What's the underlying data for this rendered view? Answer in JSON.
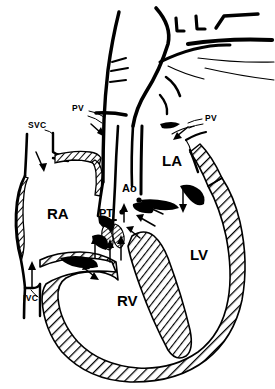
{
  "figure": {
    "type": "anatomical-line-diagram",
    "background_color": "#ffffff",
    "ink_color": "#000000",
    "width": 275,
    "height": 389
  },
  "labels": {
    "svc": "SVC",
    "ivc": "IVC",
    "pv_left": "PV",
    "pv_right": "PV",
    "ra": "RA",
    "rv": "RV",
    "la": "LA",
    "lv": "LV",
    "ao": "Ao",
    "pt": "PT"
  },
  "label_positions": {
    "svc": {
      "x": 28,
      "y": 128
    },
    "ivc": {
      "x": 23,
      "y": 301
    },
    "pv_left": {
      "x": 72,
      "y": 111
    },
    "pv_right": {
      "x": 205,
      "y": 121
    },
    "ra": {
      "x": 47,
      "y": 219
    },
    "rv": {
      "x": 117,
      "y": 306
    },
    "la": {
      "x": 162,
      "y": 166
    },
    "lv": {
      "x": 190,
      "y": 260
    },
    "ao": {
      "x": 122,
      "y": 192
    },
    "pt": {
      "x": 99,
      "y": 217
    }
  },
  "legend_meaning": {
    "SVC": "superior vena cava",
    "IVC": "inferior vena cava",
    "PV": "pulmonary veins",
    "RA": "right atrium",
    "RV": "right ventricle",
    "LA": "left atrium",
    "LV": "left ventricle",
    "Ao": "aorta",
    "PT": "pulmonary trunk"
  },
  "flow_arrows": [
    {
      "name": "svc-inflow",
      "direction": "down-right"
    },
    {
      "name": "ivc-inflow",
      "direction": "up"
    },
    {
      "name": "pv-left-inflow",
      "direction": "down-right"
    },
    {
      "name": "pv-right-inflow",
      "direction": "down-left"
    },
    {
      "name": "la-to-lv",
      "direction": "down"
    },
    {
      "name": "tricuspid-flow",
      "direction": "down-right"
    },
    {
      "name": "rv-outflow-1",
      "direction": "up"
    },
    {
      "name": "rv-outflow-2",
      "direction": "up"
    },
    {
      "name": "rv-outflow-3",
      "direction": "up-right"
    },
    {
      "name": "lv-outflow-1",
      "direction": "up-left"
    },
    {
      "name": "lv-outflow-2",
      "direction": "up-left"
    }
  ],
  "features": {
    "aortic_arch_branches": 3,
    "coronary_ostia_dots": 2,
    "hatched_myocardium": true,
    "hatched_venous_walls": true
  }
}
